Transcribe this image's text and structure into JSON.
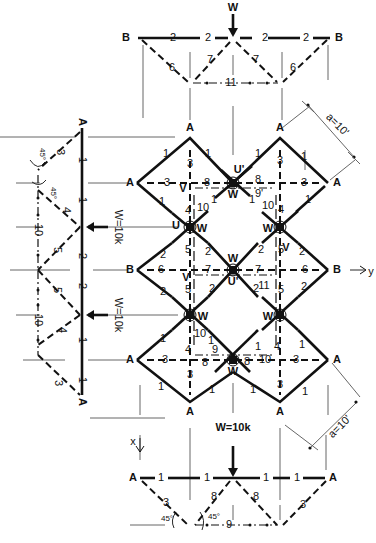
{
  "diagram": {
    "loads": {
      "top": "W",
      "left_upper": "W=10k",
      "left_lower": "W=10k",
      "bottom": "W=10k"
    },
    "dimensions": {
      "upper_right": "a=10'",
      "lower_right": "a=10'"
    },
    "angles": [
      "45°",
      "45°",
      "45°",
      "45°"
    ],
    "axes": {
      "x": "x",
      "y": "y"
    },
    "top_view": {
      "nodes": [
        "B",
        "B"
      ],
      "members": [
        "2",
        "2",
        "2",
        "2",
        "6",
        "7",
        "7",
        "6",
        "11"
      ]
    },
    "main_grid": {
      "support_nodes": [
        "A",
        "A",
        "A",
        "A",
        "A",
        "A",
        "B",
        "B"
      ],
      "joint_labels": [
        "U'",
        "W",
        "U",
        "W",
        "W",
        "W",
        "W",
        "U'",
        "W",
        "W",
        "W",
        "V",
        "V",
        "V",
        "V"
      ],
      "members_upper": [
        "1",
        "1",
        "1",
        "1",
        "1",
        "1",
        "1",
        "1",
        "3",
        "3",
        "3",
        "3",
        "8",
        "8",
        "9'",
        "4",
        "4",
        "10",
        "10"
      ],
      "members_middle": [
        "2",
        "2",
        "2",
        "2",
        "2",
        "2",
        "2",
        "2",
        "5",
        "5",
        "5",
        "5",
        "6",
        "6",
        "7",
        "7",
        "11"
      ],
      "members_lower": [
        "1",
        "1",
        "1",
        "1",
        "1",
        "1",
        "1",
        "1",
        "3",
        "3",
        "3",
        "3",
        "8",
        "8",
        "9",
        "4",
        "4",
        "10",
        "10"
      ]
    },
    "left_view": {
      "nodes": [
        "A",
        "A"
      ],
      "members": [
        "1",
        "1",
        "2",
        "2",
        "1",
        "1",
        "3",
        "4",
        "5",
        "5",
        "4",
        "3",
        "10",
        "10"
      ]
    },
    "bottom_view": {
      "nodes": [
        "A",
        "A"
      ],
      "members": [
        "1",
        "1",
        "1",
        "1",
        "3",
        "8",
        "8",
        "3",
        "9"
      ]
    }
  }
}
